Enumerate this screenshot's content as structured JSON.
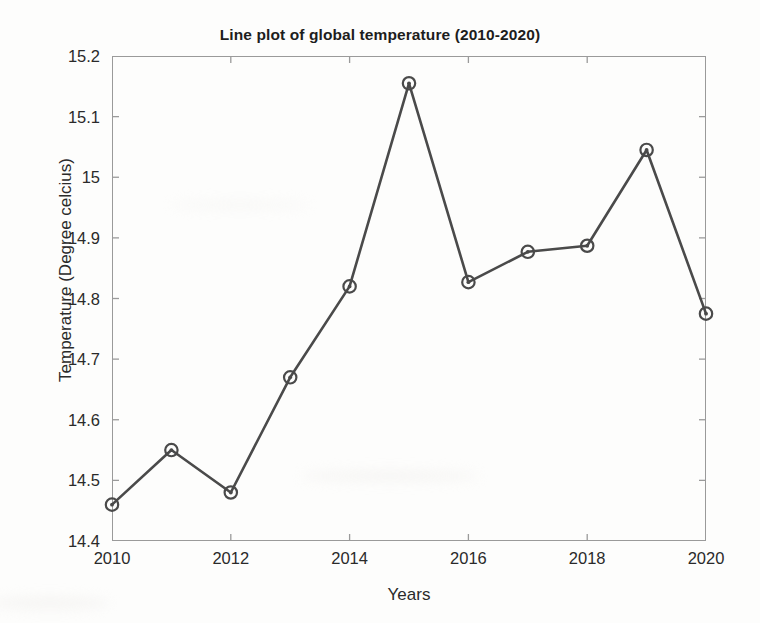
{
  "chart_data": {
    "type": "line",
    "title": "Line plot of global temperature (2010-2020)",
    "xlabel": "Years",
    "ylabel": "Temperature (Degree celcius)",
    "x": [
      2010,
      2011,
      2012,
      2013,
      2014,
      2015,
      2016,
      2017,
      2018,
      2019,
      2020
    ],
    "values": [
      14.46,
      14.55,
      14.48,
      14.67,
      14.82,
      15.155,
      14.827,
      14.877,
      14.887,
      15.045,
      14.775
    ],
    "series": [
      {
        "name": "Global temperature",
        "values": [
          14.46,
          14.55,
          14.48,
          14.67,
          14.82,
          15.155,
          14.827,
          14.877,
          14.887,
          15.045,
          14.775
        ]
      }
    ],
    "xlim": [
      2010,
      2020
    ],
    "ylim": [
      14.4,
      15.2
    ],
    "xticks": [
      2010,
      2012,
      2014,
      2016,
      2018,
      2020
    ],
    "xtick_labels": [
      "2010",
      "2012",
      "2014",
      "2016",
      "2018",
      "2020"
    ],
    "yticks": [
      14.4,
      14.5,
      14.6,
      14.7,
      14.8,
      14.9,
      15.0,
      15.1,
      15.2
    ],
    "ytick_labels": [
      "14.4",
      "14.5",
      "14.6",
      "14.7",
      "14.8",
      "14.9",
      "15",
      "15.1",
      "15.2"
    ],
    "grid": false,
    "legend": null,
    "marker": "circle-dot",
    "line_color": "#4a4a4a",
    "marker_color": "#4a4a4a",
    "axis_color": "#9a9a9a",
    "background_color": "#fdfdfc"
  }
}
